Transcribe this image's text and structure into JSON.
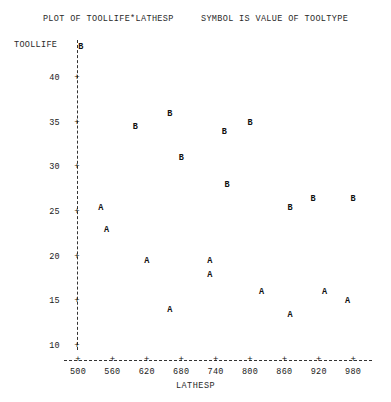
{
  "title": {
    "text": "PLOT OF TOOLLIFE*LATHESP     SYMBOL IS VALUE OF TOOLTYPE",
    "plot_of": "PLOT OF TOOLLIFE*LATHESP",
    "symbol_note": "SYMBOL IS VALUE OF TOOLTYPE"
  },
  "axes": {
    "y_title": "TOOLLIFE",
    "x_title": "LATHESP",
    "y_ticks": [
      40,
      35,
      30,
      25,
      20,
      15,
      10
    ],
    "x_ticks": [
      500,
      560,
      620,
      680,
      740,
      800,
      860,
      920,
      980
    ],
    "tick_glyph": "+"
  },
  "chart_data": {
    "type": "scatter",
    "title": "PLOT OF TOOLLIFE*LATHESP     SYMBOL IS VALUE OF TOOLTYPE",
    "xlabel": "LATHESP",
    "ylabel": "TOOLLIFE",
    "xlim": [
      480,
      1000
    ],
    "ylim": [
      8,
      45
    ],
    "grid": false,
    "legend": "none",
    "annotations": [
      "SYMBOL IS VALUE OF TOOLTYPE"
    ],
    "symbol_meaning": "Plot character encodes the TOOLTYPE category (A or B)",
    "series": [
      {
        "name": "B",
        "symbol": "B",
        "points": [
          {
            "x": 505,
            "y": 43.5
          },
          {
            "x": 600,
            "y": 34.5
          },
          {
            "x": 660,
            "y": 36.0
          },
          {
            "x": 680,
            "y": 31.0
          },
          {
            "x": 755,
            "y": 34.0
          },
          {
            "x": 760,
            "y": 28.0
          },
          {
            "x": 800,
            "y": 35.0
          },
          {
            "x": 870,
            "y": 25.5
          },
          {
            "x": 910,
            "y": 26.5
          },
          {
            "x": 980,
            "y": 26.5
          }
        ]
      },
      {
        "name": "A",
        "symbol": "A",
        "points": [
          {
            "x": 540,
            "y": 25.5
          },
          {
            "x": 550,
            "y": 23.0
          },
          {
            "x": 620,
            "y": 19.5
          },
          {
            "x": 660,
            "y": 14.0
          },
          {
            "x": 730,
            "y": 19.5
          },
          {
            "x": 730,
            "y": 18.0
          },
          {
            "x": 820,
            "y": 16.0
          },
          {
            "x": 870,
            "y": 13.5
          },
          {
            "x": 930,
            "y": 16.0
          },
          {
            "x": 970,
            "y": 15.0
          }
        ]
      }
    ]
  },
  "geometry": {
    "x_pixel_at_500": 78,
    "x_pixel_per_unit": 0.5733,
    "y_pixel_at_10": 346,
    "y_pixel_per_unit": 8.933,
    "y_axis_top": 40,
    "y_axis_bottom": 350,
    "x_axis_y": 360,
    "x_axis_left": 64,
    "x_axis_right": 372
  }
}
